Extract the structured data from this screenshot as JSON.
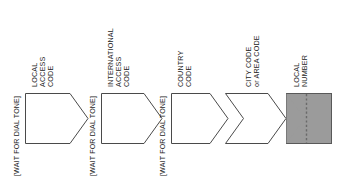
{
  "diagram": {
    "colors": {
      "stroke": "#4a4a4a",
      "text": "#1c1c1c",
      "local_number_fill": "#9b9b9b",
      "local_number_stroke": "#595959",
      "divider": "#6a6a6a",
      "background": "#ffffff"
    },
    "gates": [
      {
        "id": "gate-1",
        "label": "[WAIT FOR DIAL TONE]"
      },
      {
        "id": "gate-2",
        "label": "[WAIT FOR DIAL TONE]"
      },
      {
        "id": "gate-3",
        "label": "[WAIT FOR DIAL TONE]"
      }
    ],
    "steps": [
      {
        "id": "step-local-access-code",
        "lines": [
          "LOCAL",
          "ACCESS",
          "CODE"
        ],
        "shape": "chevron-flat-left",
        "filled": false
      },
      {
        "id": "step-international-access-code",
        "lines": [
          "INTERNATIONAL",
          "ACCESS",
          "CODE"
        ],
        "shape": "chevron-flat-left",
        "filled": false
      },
      {
        "id": "step-country-code",
        "lines": [
          "COUNTRY",
          "CODE"
        ],
        "shape": "chevron-flat-left",
        "filled": false
      },
      {
        "id": "step-city-area-code",
        "lines": [
          "CITY CODE",
          "or AREA CODE"
        ],
        "shape": "chevron-notched-left",
        "filled": false
      },
      {
        "id": "step-local-number",
        "lines": [
          "LOCAL",
          "NUMBER"
        ],
        "shape": "rectangle-with-divider",
        "filled": true
      }
    ]
  }
}
